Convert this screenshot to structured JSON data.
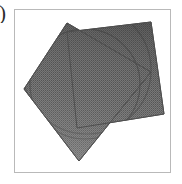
{
  "page": {
    "background_color": "#ffffff",
    "width": 182,
    "height": 184
  },
  "margin_glyph": {
    "text": ")",
    "description": "cropped-glyph-fragment-left-margin",
    "color": "#2b2b2b"
  },
  "figure": {
    "frame": {
      "border_color": "#b9b9b9",
      "background_color": "#ffffff",
      "x": 14,
      "y": 9,
      "width": 157,
      "height": 164
    },
    "caption": "Two overlapping rotated squares with dithered gray fill and inscribed circular arcs",
    "fill_color": "#6e6e6e",
    "fill_color_dark": "#4f4f4f",
    "fill_color_light": "#8c8c8c",
    "edge_color": "#5a5a5a",
    "arc_color": "#4a4a4a"
  },
  "chart_data": {
    "type": "diagram",
    "title": "",
    "xlabel": "",
    "ylabel": "",
    "grid": false,
    "legend": false,
    "shapes": [
      {
        "name": "square-back",
        "kind": "polygon",
        "rotation_deg": -22,
        "fill": "#6a6a6a",
        "stroke": "#5a5a5a",
        "points": [
          [
            52,
            22
          ],
          [
            136,
            12
          ],
          [
            149,
            104
          ],
          [
            62,
            118
          ]
        ]
      },
      {
        "name": "square-front",
        "kind": "polygon",
        "rotation_deg": 14,
        "fill": "#6e6e6e",
        "stroke": "#5a5a5a",
        "points": [
          [
            9,
            79
          ],
          [
            52,
            13
          ],
          [
            136,
            62
          ],
          [
            64,
            151
          ]
        ]
      },
      {
        "name": "arc-upper",
        "kind": "arc",
        "stroke": "#4a4a4a",
        "center": [
          70,
          74
        ],
        "radius": 55
      },
      {
        "name": "arc-lower",
        "kind": "arc",
        "stroke": "#4a4a4a",
        "center": [
          72,
          60
        ],
        "radius": 64
      }
    ]
  }
}
